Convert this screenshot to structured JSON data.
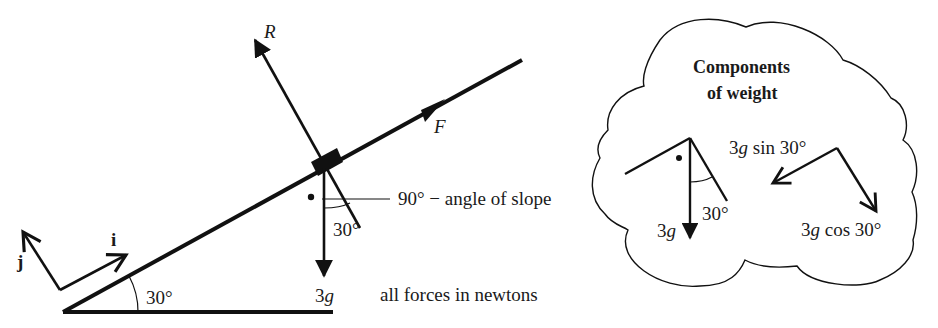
{
  "diagram": {
    "type": "inclined-plane-force-diagram",
    "slope_angle_label": "30°",
    "unit_vectors": {
      "i": "i",
      "j": "j"
    },
    "forces": {
      "reaction": "R",
      "applied": "F",
      "weight": "3g"
    },
    "weight_angle_label": "30°",
    "annotation_angle": "90° − angle of slope",
    "units_note": "all forces in newtons"
  },
  "cloud": {
    "title_line1": "Components",
    "title_line2": "of weight",
    "weight_label": "3g",
    "angle_label": "30°",
    "sin_component": "3g sin 30°",
    "cos_component": "3g cos 30°"
  },
  "colors": {
    "ink": "#111111",
    "background": "#ffffff"
  }
}
